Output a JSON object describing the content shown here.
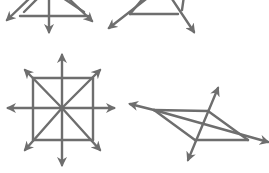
{
  "diagram": {
    "type": "geometry-figures",
    "stroke_color": "#6e6e6e",
    "background": "#ffffff",
    "figures": [
      {
        "id": "figure-top-left",
        "description": "triangle with rays extending (cropped at top)",
        "segments": [
          {
            "x1": 20,
            "y1": 16,
            "x2": 88,
            "y2": 16,
            "arrow": false
          },
          {
            "x1": 32,
            "y1": -4,
            "x2": 7,
            "y2": 20,
            "arrow": true
          },
          {
            "x1": 66,
            "y1": -4,
            "x2": 92,
            "y2": 21,
            "arrow": true
          },
          {
            "x1": 49,
            "y1": -4,
            "x2": 49,
            "y2": 32,
            "arrow": true
          },
          {
            "x1": 24,
            "y1": 12,
            "x2": 40,
            "y2": -4,
            "arrow": false
          },
          {
            "x1": 84,
            "y1": 12,
            "x2": 60,
            "y2": -4,
            "arrow": false
          }
        ]
      },
      {
        "id": "figure-top-middle",
        "description": "triangle with rays extending (cropped at top)",
        "segments": [
          {
            "x1": 130,
            "y1": 14,
            "x2": 178,
            "y2": 14,
            "arrow": false
          },
          {
            "x1": 150,
            "y1": -4,
            "x2": 109,
            "y2": 28,
            "arrow": true
          },
          {
            "x1": 170,
            "y1": -4,
            "x2": 194,
            "y2": 32,
            "arrow": true
          },
          {
            "x1": 130,
            "y1": 14,
            "x2": 145,
            "y2": -4,
            "arrow": false
          },
          {
            "x1": 182,
            "y1": 10,
            "x2": 184,
            "y2": -4,
            "arrow": false
          }
        ]
      },
      {
        "id": "figure-bottom-left",
        "description": "square with diagonals and axis rays",
        "segments": [
          {
            "x1": 33,
            "y1": 78,
            "x2": 93,
            "y2": 78,
            "arrow": false
          },
          {
            "x1": 93,
            "y1": 78,
            "x2": 93,
            "y2": 140,
            "arrow": false
          },
          {
            "x1": 93,
            "y1": 140,
            "x2": 33,
            "y2": 140,
            "arrow": false
          },
          {
            "x1": 33,
            "y1": 140,
            "x2": 33,
            "y2": 78,
            "arrow": false
          },
          {
            "x1": 62,
            "y1": 108,
            "x2": 62,
            "y2": 55,
            "arrow": true
          },
          {
            "x1": 62,
            "y1": 108,
            "x2": 62,
            "y2": 165,
            "arrow": true
          },
          {
            "x1": 62,
            "y1": 108,
            "x2": 8,
            "y2": 108,
            "arrow": true
          },
          {
            "x1": 62,
            "y1": 108,
            "x2": 114,
            "y2": 108,
            "arrow": true
          },
          {
            "x1": 62,
            "y1": 108,
            "x2": 25,
            "y2": 70,
            "arrow": true
          },
          {
            "x1": 62,
            "y1": 108,
            "x2": 100,
            "y2": 70,
            "arrow": true
          },
          {
            "x1": 62,
            "y1": 108,
            "x2": 25,
            "y2": 150,
            "arrow": true
          },
          {
            "x1": 62,
            "y1": 108,
            "x2": 100,
            "y2": 150,
            "arrow": true
          }
        ]
      },
      {
        "id": "figure-bottom-right",
        "description": "parallelogram with diagonal and transversal rays",
        "segments": [
          {
            "x1": 154,
            "y1": 110,
            "x2": 208,
            "y2": 111,
            "arrow": false
          },
          {
            "x1": 208,
            "y1": 111,
            "x2": 248,
            "y2": 140,
            "arrow": false
          },
          {
            "x1": 248,
            "y1": 140,
            "x2": 195,
            "y2": 140,
            "arrow": false
          },
          {
            "x1": 195,
            "y1": 140,
            "x2": 154,
            "y2": 110,
            "arrow": false
          },
          {
            "x1": 154,
            "y1": 110,
            "x2": 130,
            "y2": 104,
            "arrow": true
          },
          {
            "x1": 154,
            "y1": 110,
            "x2": 268,
            "y2": 142,
            "arrow": true
          },
          {
            "x1": 203,
            "y1": 124,
            "x2": 218,
            "y2": 88,
            "arrow": true
          },
          {
            "x1": 203,
            "y1": 124,
            "x2": 188,
            "y2": 160,
            "arrow": true
          }
        ]
      }
    ]
  }
}
